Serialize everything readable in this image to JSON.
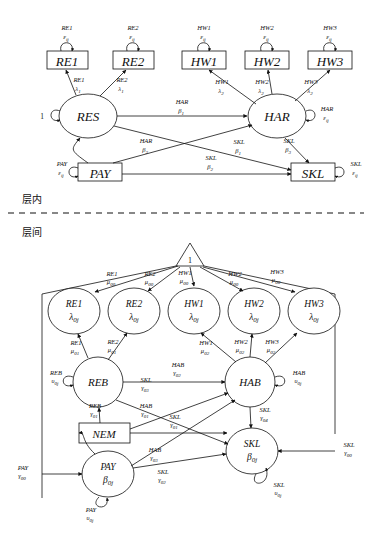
{
  "figure": {
    "type": "two-level-structural-equation-model-path-diagram",
    "level_labels": {
      "within": "层内",
      "between": "层间"
    }
  },
  "within_model": {
    "indicators": [
      {
        "id": "RE1",
        "label": "RE1",
        "shape": "rectangle",
        "residual_top": "RE1",
        "residual_sym": "ε",
        "residual_sub": "ij",
        "loading_top": "RE1",
        "loading_sym": "λ",
        "loading_sub": "1",
        "from": "RES"
      },
      {
        "id": "RE2",
        "label": "RE2",
        "shape": "rectangle",
        "residual_top": "RE2",
        "residual_sym": "ε",
        "residual_sub": "ij",
        "loading_top": "RE2",
        "loading_sym": "λ",
        "loading_sub": "1",
        "from": "RES"
      },
      {
        "id": "HW1",
        "label": "HW1",
        "shape": "rectangle",
        "residual_top": "HW1",
        "residual_sym": "ε",
        "residual_sub": "ij",
        "loading_top": "HW1",
        "loading_sym": "λ",
        "loading_sub": "2",
        "from": "HAR"
      },
      {
        "id": "HW2",
        "label": "HW2",
        "shape": "rectangle",
        "residual_top": "HW2",
        "residual_sym": "ε",
        "residual_sub": "ij",
        "loading_top": "HW2",
        "loading_sym": "λ",
        "loading_sub": "2",
        "from": "HAR"
      },
      {
        "id": "HW3",
        "label": "HW3",
        "shape": "rectangle",
        "residual_top": "HW3",
        "residual_sym": "ε",
        "residual_sub": "ij",
        "loading_top": "HW3",
        "loading_sym": "λ",
        "loading_sub": "2",
        "from": "HAR"
      }
    ],
    "latents": [
      {
        "id": "RES",
        "label": "RES",
        "shape": "ellipse",
        "variance_label": "1"
      },
      {
        "id": "HAR",
        "label": "HAR",
        "shape": "ellipse",
        "residual_top": "HAR",
        "residual_sym": "ε",
        "residual_sub": "ij"
      }
    ],
    "observed": [
      {
        "id": "PAY",
        "label": "PAY",
        "shape": "rectangle",
        "residual_top": "PAY",
        "residual_sym": "ε",
        "residual_sub": "ij"
      },
      {
        "id": "SKL",
        "label": "SKL",
        "shape": "rectangle",
        "residual_top": "SKL",
        "residual_sym": "ε",
        "residual_sub": "ij"
      }
    ],
    "paths": [
      {
        "from": "RES",
        "to": "HAR",
        "top": "HAR",
        "sym": "β",
        "sub": "1"
      },
      {
        "from": "PAY",
        "to": "HAR",
        "top": "HAR",
        "sym": "β",
        "sub": "2"
      },
      {
        "from": "HAR",
        "to": "SKL",
        "top": "SKL",
        "sym": "β",
        "sub": "3"
      },
      {
        "from": "RES",
        "to": "SKL",
        "top": "SKL",
        "sym": "β",
        "sub": "1"
      },
      {
        "from": "PAY",
        "to": "SKL",
        "top": "SKL",
        "sym": "β",
        "sub": "2"
      },
      {
        "from": "PAY",
        "to": "RES",
        "type": "curved"
      }
    ]
  },
  "between_model": {
    "constant": {
      "label": "1",
      "shape": "triangle"
    },
    "random_intercepts": [
      {
        "id": "RE1b",
        "top": "RE1",
        "sym": "λ",
        "sub": "0j",
        "mean_top": "RE1",
        "mean_sym": "μ",
        "mean_sub": "00",
        "pred_top": "RE1",
        "pred_sym": "μ",
        "pred_sub": "01",
        "pred_from": "REB"
      },
      {
        "id": "RE2b",
        "top": "RE2",
        "sym": "λ",
        "sub": "0j",
        "mean_top": "RE2",
        "mean_sym": "μ",
        "mean_sub": "00",
        "pred_top": "RE2",
        "pred_sym": "μ",
        "pred_sub": "01",
        "pred_from": "REB"
      },
      {
        "id": "HW1b",
        "top": "HW1",
        "sym": "λ",
        "sub": "0j",
        "mean_top": "HW1",
        "mean_sym": "μ",
        "mean_sub": "00",
        "pred_top": "HW1",
        "pred_sym": "μ",
        "pred_sub": "02",
        "pred_from": "HAB"
      },
      {
        "id": "HW2b",
        "top": "HW2",
        "sym": "λ",
        "sub": "0j",
        "mean_top": "HW2",
        "mean_sym": "μ",
        "mean_sub": "00",
        "pred_top": "HW2",
        "pred_sym": "μ",
        "pred_sub": "02",
        "pred_from": "HAB"
      },
      {
        "id": "HW3b",
        "top": "HW3",
        "sym": "λ",
        "sub": "0j",
        "mean_top": "HW3",
        "mean_sym": "μ",
        "mean_sub": "00",
        "pred_top": "HW3",
        "pred_sym": "μ",
        "pred_sub": "02",
        "pred_from": "HAB"
      }
    ],
    "latents": [
      {
        "id": "REB",
        "label": "REB",
        "shape": "ellipse",
        "residual_top": "REB",
        "residual_sym": "υ",
        "residual_sub": "0j"
      },
      {
        "id": "HAB",
        "label": "HAB",
        "shape": "ellipse",
        "residual_top": "HAB",
        "residual_sym": "υ",
        "residual_sub": "0j"
      },
      {
        "id": "PAYb",
        "top": "PAY",
        "sym": "β",
        "sub": "0j",
        "shape": "ellipse",
        "residual_top": "PAY",
        "residual_sym": "υ",
        "residual_sub": "0j"
      },
      {
        "id": "SKLb",
        "top": "SKL",
        "sym": "β",
        "sub": "0j",
        "shape": "ellipse",
        "residual_top": "SKL",
        "residual_sym": "υ",
        "residual_sub": "0j"
      }
    ],
    "observed": [
      {
        "id": "NEM",
        "label": "NEM",
        "shape": "rectangle"
      }
    ],
    "paths": [
      {
        "from": "NEM",
        "to": "REB",
        "top": "REB",
        "sym": "γ",
        "sub": "01"
      },
      {
        "from": "NEM",
        "to": "HAB",
        "top": "HAB",
        "sym": "γ",
        "sub": "01"
      },
      {
        "from": "NEM",
        "to": "SKLb",
        "top": "SKL",
        "sym": "γ",
        "sub": "01"
      },
      {
        "from": "REB",
        "to": "HAB",
        "top": "HAB",
        "sym": "γ",
        "sub": "02"
      },
      {
        "from": "REB",
        "to": "SKLb",
        "top": "SKL",
        "sym": "γ",
        "sub": "03"
      },
      {
        "from": "PAYb",
        "to": "HAB",
        "top": "HAB",
        "sym": "γ",
        "sub": "03"
      },
      {
        "from": "PAYb",
        "to": "SKLb",
        "top": "SKL",
        "sym": "γ",
        "sub": "02"
      },
      {
        "from": "HAB",
        "to": "SKLb",
        "top": "SKL",
        "sym": "γ",
        "sub": "04"
      },
      {
        "from": "constant",
        "to": "PAYb",
        "top": "PAY",
        "sym": "γ",
        "sub": "00"
      },
      {
        "from": "constant",
        "to": "SKLb",
        "top": "SKL",
        "sym": "γ",
        "sub": "00"
      },
      {
        "from": "PAYb",
        "to": "NEM",
        "type": "curved"
      }
    ]
  }
}
